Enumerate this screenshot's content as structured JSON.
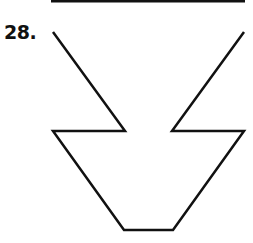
{
  "problem": {
    "number_label": "28."
  },
  "figure": {
    "stroke_color": "#111111",
    "stroke_width": 2.5,
    "top_rule": {
      "x1": 51,
      "y1": 1,
      "x2": 245,
      "y2": 1
    },
    "shape_points": [
      [
        53,
        32
      ],
      [
        125,
        131
      ],
      [
        53,
        131
      ],
      [
        124,
        230
      ],
      [
        173,
        230
      ],
      [
        244,
        131
      ],
      [
        172,
        131
      ],
      [
        244,
        32
      ]
    ]
  }
}
